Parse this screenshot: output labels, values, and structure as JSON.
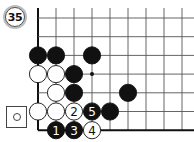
{
  "problem": {
    "number_label": "35"
  },
  "legend": {
    "icon": "white-stone-symbol"
  },
  "board": {
    "origin_x": 38,
    "origin_y": 18,
    "step_x": 18,
    "step_y": 18.7,
    "cols": 9,
    "rows": 7,
    "stone_radius": 8.6,
    "colors": {
      "black": "#111111",
      "white": "#ffffff",
      "line": "#555555",
      "edge": "#111111"
    },
    "star_points": [
      {
        "col": 3,
        "row": 3
      }
    ],
    "stones": [
      {
        "col": 0,
        "row": 2,
        "color": "black",
        "label": ""
      },
      {
        "col": 1,
        "row": 2,
        "color": "black",
        "label": ""
      },
      {
        "col": 3,
        "row": 2,
        "color": "black",
        "label": ""
      },
      {
        "col": 0,
        "row": 3,
        "color": "white",
        "label": ""
      },
      {
        "col": 1,
        "row": 3,
        "color": "white",
        "label": ""
      },
      {
        "col": 2,
        "row": 3,
        "color": "black",
        "label": ""
      },
      {
        "col": 1,
        "row": 4,
        "color": "white",
        "label": ""
      },
      {
        "col": 2,
        "row": 4,
        "color": "black",
        "label": ""
      },
      {
        "col": 5,
        "row": 4,
        "color": "black",
        "label": ""
      },
      {
        "col": 0,
        "row": 5,
        "color": "white",
        "label": ""
      },
      {
        "col": 1,
        "row": 5,
        "color": "white",
        "label": ""
      },
      {
        "col": 2,
        "row": 5,
        "color": "white",
        "label": "2"
      },
      {
        "col": 3,
        "row": 5,
        "color": "black",
        "label": "5"
      },
      {
        "col": 4,
        "row": 5,
        "color": "black",
        "label": ""
      },
      {
        "col": 1,
        "row": 6,
        "color": "black",
        "label": "1"
      },
      {
        "col": 2,
        "row": 6,
        "color": "black",
        "label": "3"
      },
      {
        "col": 3,
        "row": 6,
        "color": "white",
        "label": "4"
      }
    ]
  }
}
